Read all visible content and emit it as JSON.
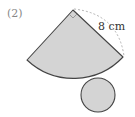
{
  "problem": {
    "number": "(2)"
  },
  "figure": {
    "type": "cone-net",
    "sector": {
      "radius_label": "8 cm",
      "central_angle": "right angle (90°)",
      "fill": "#d4d4d4",
      "stroke": "#444444"
    },
    "base_circle": {
      "fill": "#d4d4d4",
      "stroke": "#444444"
    },
    "dashed_arc_color": "#aaaaaa"
  }
}
